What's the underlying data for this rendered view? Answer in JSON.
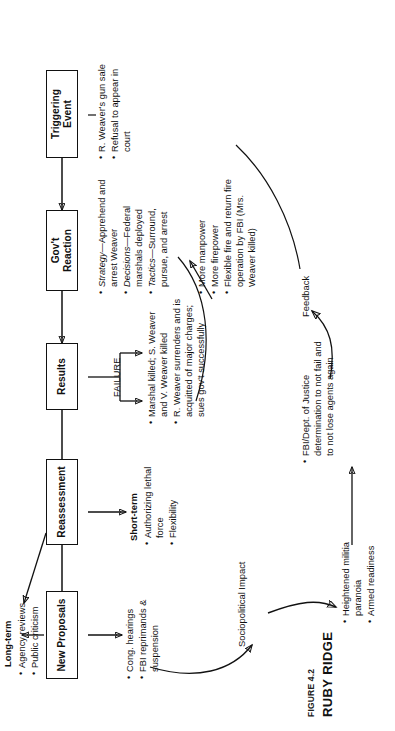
{
  "figure": {
    "number": "FIGURE 4.2",
    "title": "RUBY RIDGE",
    "type": "flowchart",
    "orientation": "rotated-90-ccw"
  },
  "nodes": [
    {
      "id": "trigger",
      "label": "Triggering Event"
    },
    {
      "id": "reaction",
      "label": "Gov't Reaction"
    },
    {
      "id": "results",
      "label": "Results"
    },
    {
      "id": "reassess",
      "label": "Reassessment"
    },
    {
      "id": "proposals",
      "label": "New Proposals"
    }
  ],
  "groups": {
    "trigger_bullets": {
      "items": [
        "R. Weaver's gun sale",
        "Refusal to appear in court"
      ]
    },
    "reaction_bullets": {
      "items": [
        {
          "lead": "Strategy",
          "text": "Apprehend and arrest Weaver"
        },
        {
          "lead": "Decisions",
          "text": "Federal marshals deployed"
        },
        {
          "lead": "Tactics",
          "text": "Surround, pursue, and arrest"
        }
      ]
    },
    "results": {
      "edge_label": "FAILURE",
      "items": [
        "Marshal killed; S. Weaver and V. Weaver killed",
        "R. Weaver surrenders and is acquitted of major charges; sues gov't successfully"
      ]
    },
    "reassessment": {
      "short_term_header": "Short-term",
      "short_term_items": [
        "Authorizing lethal force",
        "Flexibility"
      ],
      "long_term_header": "Long-term",
      "long_term_items": [
        "Agency reviews",
        "Public criticism"
      ]
    },
    "proposals": {
      "items": [
        "Cong. hearings",
        "FBI reprimands & suspension"
      ]
    },
    "sociopolitical": {
      "label": "Sociopolitical Impact",
      "items": [
        "Heightened militia paranoia",
        "Armed readiness"
      ]
    },
    "escalation": {
      "items": [
        "More manpower",
        "More firepower",
        "Flexible fire and return fire operation by FBI (Mrs. Weaver killed)"
      ]
    },
    "determination": {
      "items": [
        "FBI/Dept. of Justice determination to not fail and to not lose agents again"
      ]
    },
    "feedback": {
      "label": "Feedback"
    }
  },
  "colors": {
    "ink": "#111111",
    "paper": "#ffffff"
  }
}
